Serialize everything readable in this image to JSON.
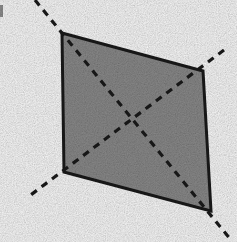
{
  "figure": {
    "title": "Shaded quadrilateral with dashed diagonals extended beyond vertices",
    "caption": "",
    "background_color": "#fefefe",
    "canvas": {
      "width": 237,
      "height": 242
    }
  },
  "shape": {
    "name": "quadrilateral",
    "fill_color": "#8c8c8c",
    "stroke_color": "#1a1a1a",
    "stroke_width": 3,
    "vertices": [
      {
        "label": "top-left",
        "x": 62,
        "y": 33
      },
      {
        "label": "top-right",
        "x": 203,
        "y": 71
      },
      {
        "label": "bottom-right",
        "x": 211,
        "y": 211
      },
      {
        "label": "bottom-left",
        "x": 64,
        "y": 172
      }
    ],
    "points_path": "62,33 203,71 211,211 64,172"
  },
  "diagonals": {
    "stroke_color": "#1a1a1a",
    "stroke_width": 3.2,
    "dash_pattern": "7,6",
    "intersection": {
      "x": 130,
      "y": 123
    },
    "lines": [
      {
        "name": "diagonal-tl-br",
        "from_label": "top-left",
        "to_label": "bottom-right",
        "x1": 35,
        "y1": 0,
        "x2": 231,
        "y2": 240
      },
      {
        "name": "diagonal-tr-bl",
        "from_label": "top-right",
        "to_label": "bottom-left",
        "x1": 224,
        "y1": 50,
        "x2": 28,
        "y2": 197
      }
    ]
  },
  "artifacts": [
    {
      "name": "scan-mark-left-edge",
      "x": 0,
      "y": 5,
      "width": 3,
      "height": 12,
      "color": "#6b6b6b"
    }
  ]
}
